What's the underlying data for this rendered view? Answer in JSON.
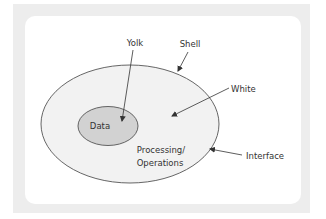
{
  "diagram": {
    "type": "egg-model",
    "nodes": {
      "shell": {
        "label": "Shell",
        "meaning": "outer ellipse boundary"
      },
      "white": {
        "label": "White",
        "meaning": "outer ellipse region"
      },
      "yolk": {
        "label": "Yolk",
        "meaning": "inner ellipse"
      },
      "data": {
        "label": "Data"
      },
      "processing": {
        "line1": "Processing/",
        "line2": "Operations"
      },
      "interface": {
        "label": "Interface"
      }
    },
    "colors": {
      "frame": "#ededed",
      "card": "#ffffff",
      "outer_fill": "#f2f2f2",
      "outer_stroke": "#555555",
      "inner_fill": "#d2d2d2",
      "inner_stroke": "#555555",
      "arrow": "#333333",
      "text": "#333333"
    }
  }
}
